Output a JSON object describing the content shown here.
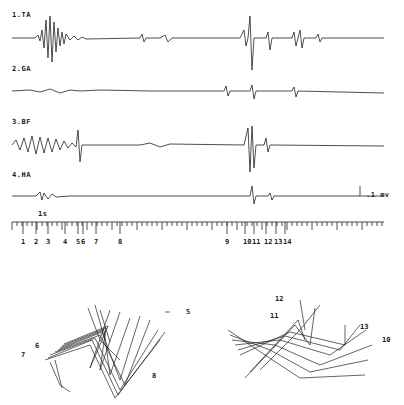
{
  "figure": {
    "traces": [
      {
        "id": "1",
        "label": "1.TA",
        "y": 38
      },
      {
        "id": "2",
        "label": "2.GA",
        "y": 91
      },
      {
        "id": "3",
        "label": "3.BF",
        "y": 145
      },
      {
        "id": "4",
        "label": "4.HA",
        "y": 196
      }
    ],
    "calibration": ".1 mv",
    "time_scale": "1s",
    "markers": [
      "1",
      "2",
      "3",
      "4",
      "5",
      "6",
      "7",
      "8",
      "9",
      "10",
      "11",
      "12",
      "13",
      "14"
    ],
    "stick_left_labels": [
      "5",
      "6",
      "7",
      "8"
    ],
    "stick_right_labels": [
      "12",
      "11",
      "13",
      "10"
    ]
  }
}
